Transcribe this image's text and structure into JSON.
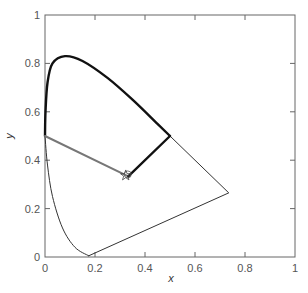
{
  "chart_data": {
    "type": "line",
    "title": "",
    "xlabel": "x",
    "ylabel": "y",
    "xlim": [
      0,
      1
    ],
    "ylim": [
      0,
      1
    ],
    "grid": false,
    "x_ticks": [
      "0",
      "0.2",
      "0.4",
      "0.6",
      "0.8",
      "1"
    ],
    "y_ticks": [
      "0",
      "0.2",
      "0.4",
      "0.6",
      "0.8",
      "1"
    ],
    "series": [
      {
        "name": "spectral-locus-bold",
        "style": "thick black",
        "points": [
          [
            0.0,
            0.5
          ],
          [
            0.002,
            0.6
          ],
          [
            0.01,
            0.72
          ],
          [
            0.03,
            0.8
          ],
          [
            0.08,
            0.83
          ],
          [
            0.15,
            0.81
          ],
          [
            0.25,
            0.74
          ],
          [
            0.35,
            0.65
          ],
          [
            0.45,
            0.55
          ],
          [
            0.5,
            0.5
          ]
        ]
      },
      {
        "name": "spectral-locus-thin",
        "style": "thin black",
        "points": [
          [
            0.0,
            0.5
          ],
          [
            0.01,
            0.38
          ],
          [
            0.03,
            0.25
          ],
          [
            0.07,
            0.12
          ],
          [
            0.12,
            0.04
          ],
          [
            0.175,
            0.005
          ]
        ]
      },
      {
        "name": "purple-and-red-boundary",
        "style": "thin black",
        "points": [
          [
            0.175,
            0.005
          ],
          [
            0.735,
            0.265
          ],
          [
            0.5,
            0.5
          ]
        ]
      },
      {
        "name": "gray-line-to-white",
        "style": "medium gray",
        "points": [
          [
            0.0,
            0.5
          ],
          [
            0.333,
            0.333
          ]
        ]
      },
      {
        "name": "black-line-to-white",
        "style": "thick black",
        "points": [
          [
            0.5,
            0.5
          ],
          [
            0.333,
            0.333
          ]
        ]
      }
    ],
    "markers": [
      {
        "name": "white-point",
        "shape": "star-and-circle",
        "x": 0.323,
        "y": 0.337
      }
    ]
  }
}
